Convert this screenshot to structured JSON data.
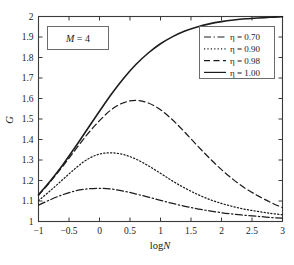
{
  "chart_data": {
    "type": "line",
    "title": "",
    "xlabel": "logN",
    "ylabel": "G",
    "xlim": [
      -1,
      3
    ],
    "ylim": [
      1,
      2
    ],
    "grid": false,
    "legend_position": "upper right",
    "xticks": [
      -1,
      -0.5,
      0,
      0.5,
      1,
      1.5,
      2,
      2.5,
      3
    ],
    "xticklabels": [
      "-1",
      "-0.5",
      "0",
      "0.5",
      "1",
      "1.5",
      "2",
      "2.5",
      "3"
    ],
    "yticks": [
      1,
      1.1,
      1.2,
      1.3,
      1.4,
      1.5,
      1.6,
      1.7,
      1.8,
      1.9,
      2
    ],
    "yticklabels": [
      "1",
      "1.1",
      "1.2",
      "1.3",
      "1.4",
      "1.5",
      "1.6",
      "1.7",
      "1.8",
      "1.9",
      "2"
    ],
    "annotation": "M = 4",
    "annotation_symbol": "M",
    "annotation_value": "4",
    "x": [
      -1,
      -0.8,
      -0.6,
      -0.4,
      -0.2,
      0,
      0.2,
      0.4,
      0.6,
      0.8,
      1,
      1.2,
      1.4,
      1.6,
      1.8,
      2,
      2.2,
      2.4,
      2.6,
      2.8,
      3
    ],
    "series": [
      {
        "name": "eta = 0.70",
        "label": "η = 0.70",
        "eta": 0.7,
        "style": "dashdot",
        "peak_x": 0.0,
        "peak_y": 1.16,
        "values": [
          1.08,
          1.107,
          1.131,
          1.149,
          1.159,
          1.162,
          1.158,
          1.148,
          1.134,
          1.119,
          1.103,
          1.088,
          1.074,
          1.062,
          1.052,
          1.043,
          1.036,
          1.03,
          1.025,
          1.02,
          1.016
        ]
      },
      {
        "name": "eta = 0.90",
        "label": "η = 0.90",
        "eta": 0.9,
        "style": "dotted",
        "peak_x": 0.15,
        "peak_y": 1.335,
        "values": [
          1.102,
          1.152,
          1.205,
          1.258,
          1.303,
          1.329,
          1.335,
          1.326,
          1.304,
          1.272,
          1.235,
          1.197,
          1.163,
          1.133,
          1.108,
          1.088,
          1.072,
          1.059,
          1.049,
          1.04,
          1.033
        ]
      },
      {
        "name": "eta = 0.98",
        "label": "η = 0.98",
        "eta": 0.98,
        "style": "dashed",
        "peak_x": 0.45,
        "peak_y": 1.592,
        "values": [
          1.128,
          1.196,
          1.27,
          1.348,
          1.425,
          1.492,
          1.547,
          1.58,
          1.591,
          1.578,
          1.545,
          1.495,
          1.435,
          1.371,
          1.31,
          1.253,
          1.203,
          1.16,
          1.125,
          1.094,
          1.067
        ]
      },
      {
        "name": "eta = 1.00",
        "label": "η = 1.00",
        "eta": 1.0,
        "style": "solid",
        "values": [
          1.13,
          1.2,
          1.277,
          1.362,
          1.45,
          1.538,
          1.623,
          1.7,
          1.767,
          1.822,
          1.867,
          1.902,
          1.929,
          1.949,
          1.964,
          1.975,
          1.983,
          1.989,
          1.993,
          1.996,
          1.999
        ]
      }
    ]
  }
}
